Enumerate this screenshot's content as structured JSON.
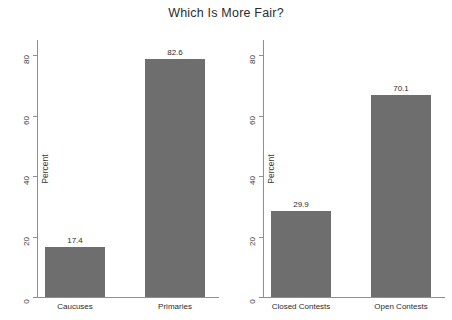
{
  "chart_data": {
    "type": "bar",
    "title": "Which Is More Fair?",
    "xlabel": "",
    "ylabel": "Percent",
    "ylim": [
      0,
      85
    ],
    "yticks": [
      0,
      20,
      40,
      60,
      80
    ],
    "grid": false,
    "legend": "none",
    "bar_color": "#6e6e6e",
    "axis_color": "#8e8e8e",
    "panels": [
      {
        "name": "caucuses-vs-primaries",
        "ylabel": "Percent",
        "categories": [
          "Caucuses",
          "Primaries"
        ],
        "values": [
          17.4,
          82.6
        ],
        "value_labels": [
          "17.4",
          "82.6"
        ],
        "yticks": [
          "0",
          "20",
          "40",
          "60",
          "80"
        ]
      },
      {
        "name": "closed-vs-open-contests",
        "ylabel": "Percent",
        "categories": [
          "Closed Contests",
          "Open Contests"
        ],
        "values": [
          29.9,
          70.1
        ],
        "value_labels": [
          "29.9",
          "70.1"
        ],
        "yticks": [
          "0",
          "20",
          "40",
          "60",
          "80"
        ]
      }
    ]
  }
}
